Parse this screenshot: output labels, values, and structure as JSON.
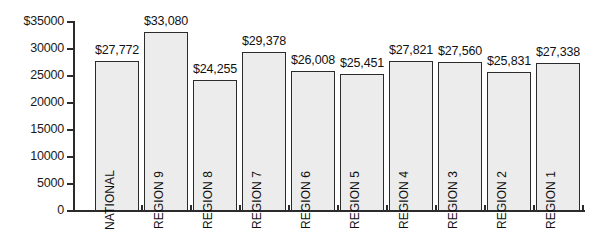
{
  "chart_data": {
    "type": "bar",
    "title": "",
    "subtitle": "",
    "xlabel": "",
    "ylabel": "",
    "categories": [
      "NATIONAL",
      "REGION 9",
      "REGION 8",
      "REGION 7",
      "REGION 6",
      "REGION 5",
      "REGION 4",
      "REGION 3",
      "REGION 2",
      "REGION 1"
    ],
    "values": [
      27772,
      33080,
      24255,
      29378,
      26008,
      25451,
      27821,
      27560,
      25831,
      27338
    ],
    "value_labels": [
      "$27,772",
      "$33,080",
      "$24,255",
      "$29,378",
      "$26,008",
      "$25,451",
      "$27,821",
      "$27,560",
      "$25,831",
      "$27,338"
    ],
    "ylim": [
      0,
      35000
    ],
    "ytick_values": [
      35000,
      30000,
      25000,
      20000,
      15000,
      10000,
      5000,
      0
    ],
    "ytick_labels": [
      "$35000",
      "30000",
      "25000",
      "20000",
      "15000",
      "10000",
      "5000",
      "0"
    ],
    "grid": false,
    "legend": null,
    "legend_position": "none",
    "bar_fill_color": "#ececec",
    "bar_edge_color": "#2b2b2b",
    "axis_color": "#2b2b2b",
    "text_color": "#111111",
    "background_color": "#ffffff",
    "category_label_rotation": "90",
    "category_label_placement": "inside-bar"
  }
}
